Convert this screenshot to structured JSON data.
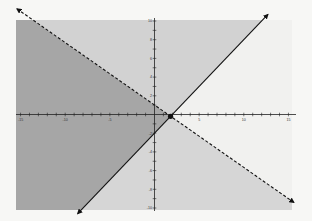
{
  "chart_data": {
    "type": "line",
    "title": "",
    "xlabel": "",
    "ylabel": "",
    "xlim": [
      -15,
      15
    ],
    "ylim": [
      -10,
      10
    ],
    "grid": false,
    "x_ticks": [
      -15,
      -10,
      -5,
      5,
      10,
      15
    ],
    "y_ticks": [
      -10,
      -8,
      -6,
      -4,
      -2,
      2,
      4,
      6,
      8,
      10
    ],
    "series": [
      {
        "name": "boundary-solid",
        "equation": "y = x - 2",
        "style": "solid",
        "x": [
          -8.6,
          12.7
        ],
        "y": [
          -10.6,
          10.7
        ],
        "arrows": "both"
      },
      {
        "name": "boundary-dashed",
        "equation": "y = -2/3 x + 1",
        "style": "dashed",
        "x": [
          -15.4,
          15.6
        ],
        "y": [
          11.3,
          -9.4
        ],
        "arrows": "both"
      }
    ],
    "intersection_point": {
      "x": 1.8,
      "y": -0.2
    },
    "regions": [
      {
        "name": "below-dashed-left-of-solid",
        "shade": "dark",
        "color": "#a6a6a6"
      },
      {
        "name": "above-dashed-left-of-solid",
        "shade": "light",
        "color": "#d2d2d2"
      },
      {
        "name": "below-dashed-right-of-solid",
        "shade": "light",
        "color": "#d6d6d6"
      },
      {
        "name": "above-dashed-right-of-solid",
        "shade": "none",
        "color": "#f1f1ef"
      }
    ]
  },
  "colors": {
    "background": "#f7f7f5",
    "axis": "#222222",
    "line": "#111111"
  }
}
